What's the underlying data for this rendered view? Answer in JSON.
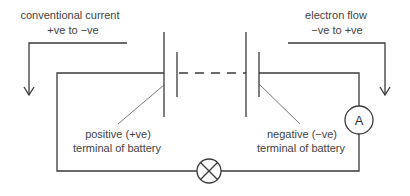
{
  "diagram": {
    "labels": {
      "conventional_line1": "conventional current",
      "conventional_line2": "+ve to −ve",
      "electron_line1": "electron flow",
      "electron_line2": "−ve to +ve",
      "positive_line1": "positive (+ve)",
      "positive_line2": "terminal of battery",
      "negative_line1": "negative (−ve)",
      "negative_line2": "terminal of battery",
      "ammeter_symbol": "A"
    },
    "components": [
      {
        "type": "battery",
        "cells": "multiple (dashed connection)",
        "positive_side": "left",
        "negative_side": "right"
      },
      {
        "type": "ammeter",
        "symbol": "A",
        "position": "right side"
      },
      {
        "type": "lamp",
        "symbol": "circle-with-cross",
        "position": "bottom center"
      }
    ],
    "arrows": [
      {
        "name": "conventional-current-arrow",
        "direction": "right-to-left then down",
        "side": "left"
      },
      {
        "name": "electron-flow-arrow",
        "direction": "left-to-right then down",
        "side": "right"
      }
    ],
    "colors": {
      "line": "#3a3a3a",
      "text": "#3f3f3f",
      "background": "#ffffff"
    }
  }
}
